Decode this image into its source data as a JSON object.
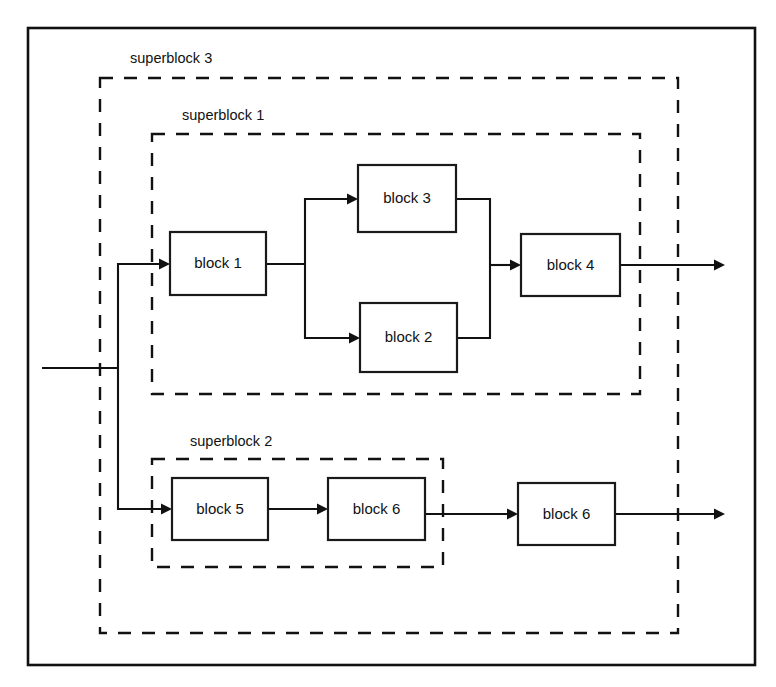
{
  "diagram": {
    "background_color": "#ffffff",
    "line_color": "#111111",
    "canvas": {
      "width": 776,
      "height": 687
    },
    "outer_frame": {
      "x": 28,
      "y": 28,
      "width": 727,
      "height": 637,
      "style": "solid"
    },
    "superblocks": [
      {
        "id": "superblock-3",
        "label": "superblock 3",
        "label_x": 130,
        "label_y": 63,
        "x": 100,
        "y": 78,
        "width": 578,
        "height": 555,
        "style": "dashed"
      },
      {
        "id": "superblock-1",
        "label": "superblock 1",
        "label_x": 182,
        "label_y": 120,
        "x": 152,
        "y": 134,
        "width": 488,
        "height": 260,
        "style": "dashed"
      },
      {
        "id": "superblock-2",
        "label": "superblock 2",
        "label_x": 190,
        "label_y": 446,
        "x": 152,
        "y": 459,
        "width": 291,
        "height": 108,
        "style": "dashed"
      }
    ],
    "blocks": [
      {
        "id": "block-1",
        "label": "block 1",
        "x": 170,
        "y": 232,
        "width": 96,
        "height": 63
      },
      {
        "id": "block-3",
        "label": "block 3",
        "x": 358,
        "y": 165,
        "width": 98,
        "height": 67
      },
      {
        "id": "block-2",
        "label": "block 2",
        "x": 360,
        "y": 303,
        "width": 97,
        "height": 69
      },
      {
        "id": "block-4",
        "label": "block 4",
        "x": 521,
        "y": 234,
        "width": 99,
        "height": 62
      },
      {
        "id": "block-5",
        "label": "block 5",
        "x": 172,
        "y": 478,
        "width": 96,
        "height": 62
      },
      {
        "id": "block-6-inner",
        "label": "block 6",
        "x": 328,
        "y": 478,
        "width": 97,
        "height": 62
      },
      {
        "id": "block-6-outer",
        "label": "block 6",
        "x": 518,
        "y": 483,
        "width": 97,
        "height": 62
      }
    ],
    "connections": [
      {
        "id": "input-trunk",
        "from": "external-input",
        "to": "fork",
        "path": "M 42 368 L 118 368",
        "arrow": null
      },
      {
        "id": "fork-up",
        "from": "fork",
        "to": "block-1",
        "path": "M 118 368 L 118 264 L 162 264",
        "arrow": {
          "x": 170,
          "y": 264,
          "dir": "right"
        }
      },
      {
        "id": "fork-down",
        "from": "fork",
        "to": "block-5",
        "path": "M 118 368 L 118 509 L 164 509",
        "arrow": {
          "x": 172,
          "y": 509,
          "dir": "right"
        }
      },
      {
        "id": "b1-split",
        "from": "block-1",
        "to": "split-node",
        "path": "M 266 264 L 305 264",
        "arrow": null
      },
      {
        "id": "split-to-b3",
        "from": "split-node",
        "to": "block-3",
        "path": "M 305 264 L 305 199 L 350 199",
        "arrow": {
          "x": 358,
          "y": 199,
          "dir": "right"
        }
      },
      {
        "id": "split-to-b2",
        "from": "split-node",
        "to": "block-2",
        "path": "M 305 264 L 305 338 L 352 338",
        "arrow": {
          "x": 360,
          "y": 338,
          "dir": "right"
        }
      },
      {
        "id": "b3-to-merge",
        "from": "block-3",
        "to": "merge-node",
        "path": "M 456 199 L 490 199 L 490 265",
        "arrow": null
      },
      {
        "id": "b2-to-merge",
        "from": "block-2",
        "to": "merge-node",
        "path": "M 457 338 L 490 338 L 490 265",
        "arrow": null
      },
      {
        "id": "merge-to-b4",
        "from": "merge-node",
        "to": "block-4",
        "path": "M 490 265 L 513 265",
        "arrow": {
          "x": 521,
          "y": 265,
          "dir": "right"
        }
      },
      {
        "id": "b4-output",
        "from": "block-4",
        "to": "external-output-top",
        "path": "M 620 265 L 717 265",
        "arrow": {
          "x": 725,
          "y": 265,
          "dir": "right"
        }
      },
      {
        "id": "b5-to-b6inner",
        "from": "block-5",
        "to": "block-6-inner",
        "path": "M 268 509 L 320 509",
        "arrow": {
          "x": 328,
          "y": 509,
          "dir": "right"
        }
      },
      {
        "id": "b6inner-to-b6outer",
        "from": "block-6-inner",
        "to": "block-6-outer",
        "path": "M 425 509 L 425 514 L 510 514",
        "arrow": {
          "x": 518,
          "y": 514,
          "dir": "right"
        }
      },
      {
        "id": "b6outer-output",
        "from": "block-6-outer",
        "to": "external-output-bottom",
        "path": "M 615 514 L 717 514",
        "arrow": {
          "x": 725,
          "y": 514,
          "dir": "right"
        }
      }
    ]
  }
}
